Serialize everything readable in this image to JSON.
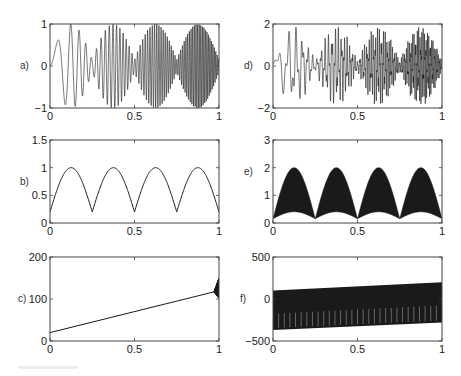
{
  "figure": {
    "layout": {
      "rows": 3,
      "cols": 2
    },
    "colors": {
      "line": "#1a1a1a",
      "axes": "#444444",
      "background": "#ffffff"
    }
  },
  "chart_data": [
    {
      "id": "a",
      "panel_label": "a)",
      "type": "line",
      "title": "",
      "xlabel": "",
      "ylabel": "",
      "xlim": [
        0,
        1
      ],
      "ylim": [
        -1,
        1
      ],
      "xticks": [
        "0",
        "0.5",
        "1"
      ],
      "yticks": [
        "-1",
        "0",
        "1"
      ],
      "description": "Chirp-like oscillation (frequency increasing with x) with amplitude modulated |sin(4πx)|-like envelope; 4 lobes peaking near x=0.125, 0.375, 0.625, 0.875 at amplitude ~1, nodes near 0.25, 0.5, 0.75",
      "signal": {
        "kind": "am_chirp",
        "amp": 1.0,
        "f0": 3,
        "f1": 120,
        "envelope_lobes": 4,
        "envelope_floor": 0.15
      }
    },
    {
      "id": "b",
      "panel_label": "b)",
      "type": "line",
      "title": "",
      "xlabel": "",
      "ylabel": "",
      "xlim": [
        0,
        1
      ],
      "ylim": [
        0,
        1.5
      ],
      "xticks": [
        "0",
        "0.5",
        "1"
      ],
      "yticks": [
        "0",
        "0.5",
        "1",
        "1.5"
      ],
      "description": "Envelope / instantaneous amplitude of a): 4 smooth arches between ~0.2 and 1",
      "x": [
        0,
        0.125,
        0.25,
        0.375,
        0.5,
        0.625,
        0.75,
        0.875,
        1
      ],
      "y": [
        0.2,
        1.0,
        0.2,
        1.0,
        0.2,
        1.0,
        0.2,
        1.0,
        0.2
      ],
      "signal": {
        "kind": "arches",
        "min": 0.2,
        "max": 1.0,
        "lobes": 4
      }
    },
    {
      "id": "c",
      "panel_label": "c)",
      "type": "line",
      "title": "",
      "xlabel": "",
      "ylabel": "",
      "xlim": [
        0,
        1
      ],
      "ylim": [
        0,
        200
      ],
      "xticks": [
        "0",
        "0.5",
        "1"
      ],
      "yticks": [
        "0",
        "100",
        "200"
      ],
      "description": "Instantaneous frequency: linear increase from ~20 at x=0 to ~120 at x=1 with small oscillation burst at the right edge",
      "x": [
        0,
        0.25,
        0.5,
        0.75,
        1
      ],
      "y": [
        20,
        45,
        70,
        95,
        120
      ],
      "signal": {
        "kind": "linear",
        "y0": 20,
        "y1": 120,
        "edge_burst": 30
      }
    },
    {
      "id": "d",
      "panel_label": "d)",
      "type": "line",
      "title": "",
      "xlabel": "",
      "ylabel": "",
      "xlim": [
        0,
        1
      ],
      "ylim": [
        -2,
        2
      ],
      "xticks": [
        "0",
        "0.5",
        "1"
      ],
      "yticks": [
        "-2",
        "0",
        "2"
      ],
      "description": "Noisy/multi-component version of a) with amplitude up to ~2; four lobes with peaks near x=0.125, 0.375, 0.625, 0.875",
      "signal": {
        "kind": "am_chirp_noisy",
        "amp": 1.9,
        "f0": 8,
        "f1": 130,
        "envelope_lobes": 4,
        "envelope_floor": 0.12
      }
    },
    {
      "id": "e",
      "panel_label": "e)",
      "type": "area",
      "title": "",
      "xlabel": "",
      "ylabel": "",
      "xlim": [
        0,
        1
      ],
      "ylim": [
        0,
        3
      ],
      "xticks": [
        "0",
        "0.5",
        "1"
      ],
      "yticks": [
        "0",
        "1",
        "2",
        "3"
      ],
      "description": "Dense filled band: upper envelope arches from ~0.15 to 2, lower envelope arches from ~0.15 to ~0.65; 4 lobes",
      "upper": {
        "min": 0.15,
        "max": 2.0,
        "lobes": 4
      },
      "lower": {
        "min": 0.15,
        "max": 0.65,
        "lobes": 4
      }
    },
    {
      "id": "f",
      "panel_label": "f)",
      "type": "area",
      "title": "",
      "xlabel": "",
      "ylabel": "",
      "xlim": [
        0,
        1
      ],
      "ylim": [
        -500,
        500
      ],
      "xticks": [
        "0",
        "0.5",
        "1"
      ],
      "yticks": [
        "-500",
        "0",
        "500"
      ],
      "description": "Dense oscillating band: upper edge rising linearly from ~100 to ~200, lower edge rising from ~-370 to ~-280, with periodic light vertical gaps",
      "upper": {
        "y0": 100,
        "y1": 200
      },
      "lower": {
        "y0": -370,
        "y1": -280
      },
      "gaps": 30
    }
  ]
}
